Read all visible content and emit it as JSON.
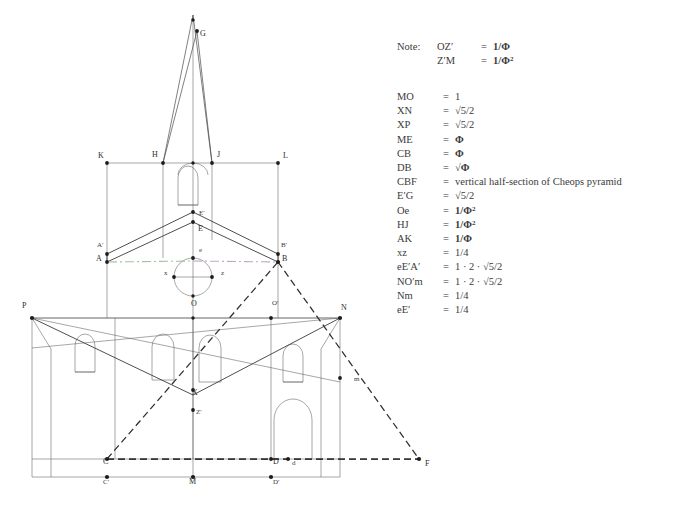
{
  "figure": {
    "note_label": "Note:",
    "notes": [
      {
        "lhs": "OZ′",
        "eq": "=",
        "rhs": "1/Φ",
        "sup": ""
      },
      {
        "lhs": "Z′M",
        "eq": "=",
        "rhs": "1/Φ",
        "sup": "2"
      }
    ],
    "legend": [
      {
        "lhs": "MO",
        "eq": "=",
        "rhs": "1",
        "sup": ""
      },
      {
        "lhs": "XN",
        "eq": "=",
        "rhs": "√5/2",
        "sup": ""
      },
      {
        "lhs": "XP",
        "eq": "=",
        "rhs": "√5/2",
        "sup": ""
      },
      {
        "lhs": "ME",
        "eq": "=",
        "rhs": "Φ",
        "sup": ""
      },
      {
        "lhs": "CB",
        "eq": "=",
        "rhs": "Φ",
        "sup": ""
      },
      {
        "lhs": "DB",
        "eq": "=",
        "rhs": "√Φ",
        "sup": ""
      },
      {
        "lhs": "CBF",
        "eq": "=",
        "rhs": "vertical half-section of Cheops pyramid",
        "sup": ""
      },
      {
        "lhs": "E′G",
        "eq": "=",
        "rhs": "√5/2",
        "sup": ""
      },
      {
        "lhs": "Oe",
        "eq": "=",
        "rhs": "1/Φ",
        "sup": "2"
      },
      {
        "lhs": "HJ",
        "eq": "=",
        "rhs": "1/Φ",
        "sup": "2"
      },
      {
        "lhs": "AK",
        "eq": "=",
        "rhs": "1/Φ",
        "sup": ""
      },
      {
        "lhs": "xz",
        "eq": "=",
        "rhs": "1/4",
        "sup": ""
      },
      {
        "lhs": "eE′A′",
        "eq": "=",
        "rhs": "1 · 2 · √5/2",
        "sup": ""
      },
      {
        "lhs": "NO′m",
        "eq": "=",
        "rhs": "1 · 2 · √5/2",
        "sup": ""
      },
      {
        "lhs": "Nm",
        "eq": "=",
        "rhs": "1/4",
        "sup": ""
      },
      {
        "lhs": "eE′",
        "eq": "=",
        "rhs": "1/4",
        "sup": ""
      }
    ],
    "point_labels": [
      {
        "id": "G",
        "text": "G",
        "x": 200,
        "y": 36
      },
      {
        "id": "K",
        "text": "K",
        "x": 98,
        "y": 158
      },
      {
        "id": "H",
        "text": "H",
        "x": 152,
        "y": 157
      },
      {
        "id": "J",
        "text": "J",
        "x": 217,
        "y": 157
      },
      {
        "id": "L",
        "text": "L",
        "x": 283,
        "y": 158
      },
      {
        "id": "Ep",
        "text": "E′",
        "x": 199,
        "y": 215
      },
      {
        "id": "E",
        "text": "E",
        "x": 198,
        "y": 231
      },
      {
        "id": "Ap",
        "text": "A′",
        "x": 97,
        "y": 247
      },
      {
        "id": "Bp",
        "text": "B′",
        "x": 281,
        "y": 247
      },
      {
        "id": "A",
        "text": "A",
        "x": 96,
        "y": 261
      },
      {
        "id": "B",
        "text": "B",
        "x": 282,
        "y": 261
      },
      {
        "id": "e",
        "text": "e",
        "x": 199,
        "y": 252
      },
      {
        "id": "x",
        "text": "x",
        "x": 164,
        "y": 275
      },
      {
        "id": "z",
        "text": "z",
        "x": 221,
        "y": 275
      },
      {
        "id": "O",
        "text": "O",
        "x": 191,
        "y": 306
      },
      {
        "id": "Op",
        "text": "O′",
        "x": 272,
        "y": 305
      },
      {
        "id": "P",
        "text": "P",
        "x": 22,
        "y": 308
      },
      {
        "id": "N",
        "text": "N",
        "x": 341,
        "y": 310
      },
      {
        "id": "m",
        "text": "m",
        "x": 354,
        "y": 381
      },
      {
        "id": "X",
        "text": "X",
        "x": 192,
        "y": 395
      },
      {
        "id": "Zp",
        "text": "Z′",
        "x": 196,
        "y": 414
      },
      {
        "id": "C",
        "text": "C",
        "x": 103,
        "y": 464
      },
      {
        "id": "D",
        "text": "D",
        "x": 273,
        "y": 464
      },
      {
        "id": "d",
        "text": "d",
        "x": 292,
        "y": 465
      },
      {
        "id": "F",
        "text": "F",
        "x": 425,
        "y": 466
      },
      {
        "id": "Cp",
        "text": "C′",
        "x": 103,
        "y": 484
      },
      {
        "id": "M",
        "text": "M",
        "x": 189,
        "y": 484
      },
      {
        "id": "Dp",
        "text": "D′",
        "x": 273,
        "y": 484
      }
    ]
  }
}
